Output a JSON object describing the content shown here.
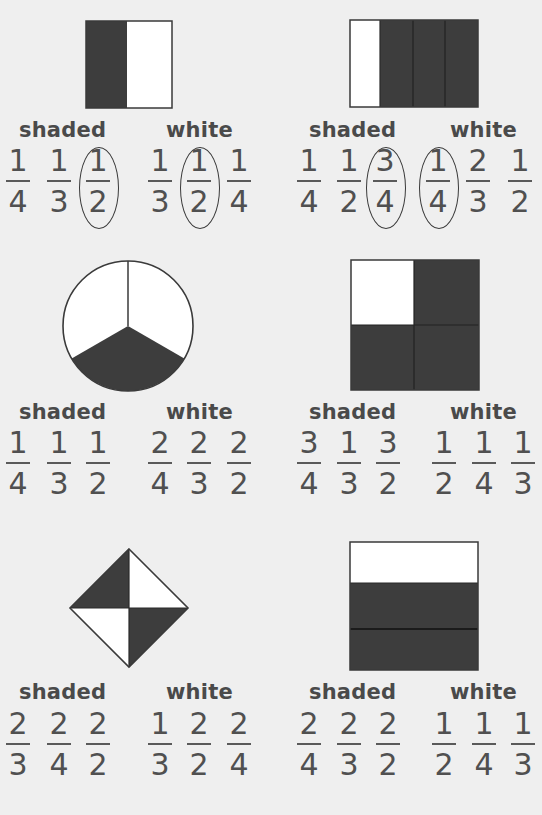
{
  "colors": {
    "background": "#efefef",
    "shaded": "#3d3d3d",
    "white": "#ffffff",
    "text": "#4a4a4a"
  },
  "labels": {
    "shaded": "shaded",
    "white": "white"
  },
  "problems": [
    {
      "shape": "rectangle-2-columns",
      "shaded": [
        {
          "n": "1",
          "d": "4"
        },
        {
          "n": "1",
          "d": "3"
        },
        {
          "n": "1",
          "d": "2",
          "circled": true
        }
      ],
      "white": [
        {
          "n": "1",
          "d": "3"
        },
        {
          "n": "1",
          "d": "2",
          "circled": true
        },
        {
          "n": "1",
          "d": "4"
        }
      ]
    },
    {
      "shape": "rectangle-4-columns",
      "shaded": [
        {
          "n": "1",
          "d": "4"
        },
        {
          "n": "1",
          "d": "2"
        },
        {
          "n": "3",
          "d": "4",
          "circled": true
        }
      ],
      "white": [
        {
          "n": "1",
          "d": "4",
          "circled": true
        },
        {
          "n": "2",
          "d": "3"
        },
        {
          "n": "1",
          "d": "2"
        }
      ]
    },
    {
      "shape": "circle-3-sectors",
      "shaded": [
        {
          "n": "1",
          "d": "4"
        },
        {
          "n": "1",
          "d": "3"
        },
        {
          "n": "1",
          "d": "2"
        }
      ],
      "white": [
        {
          "n": "2",
          "d": "4"
        },
        {
          "n": "2",
          "d": "3"
        },
        {
          "n": "2",
          "d": "2"
        }
      ]
    },
    {
      "shape": "square-2x2",
      "shaded": [
        {
          "n": "3",
          "d": "4"
        },
        {
          "n": "1",
          "d": "3"
        },
        {
          "n": "3",
          "d": "2"
        }
      ],
      "white": [
        {
          "n": "1",
          "d": "2"
        },
        {
          "n": "1",
          "d": "4"
        },
        {
          "n": "1",
          "d": "3"
        }
      ]
    },
    {
      "shape": "diamond-4-triangles",
      "shaded": [
        {
          "n": "2",
          "d": "3"
        },
        {
          "n": "2",
          "d": "4"
        },
        {
          "n": "2",
          "d": "2"
        }
      ],
      "white": [
        {
          "n": "1",
          "d": "3"
        },
        {
          "n": "2",
          "d": "2"
        },
        {
          "n": "2",
          "d": "4"
        }
      ]
    },
    {
      "shape": "rectangle-3-rows",
      "shaded": [
        {
          "n": "2",
          "d": "4"
        },
        {
          "n": "2",
          "d": "3"
        },
        {
          "n": "2",
          "d": "2"
        }
      ],
      "white": [
        {
          "n": "1",
          "d": "2"
        },
        {
          "n": "1",
          "d": "4"
        },
        {
          "n": "1",
          "d": "3"
        }
      ]
    }
  ]
}
